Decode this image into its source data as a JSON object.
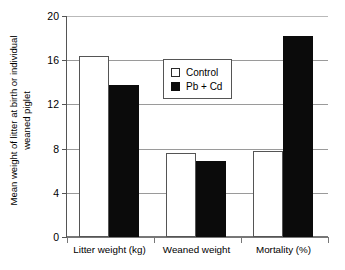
{
  "chart_data": {
    "type": "bar",
    "title": "",
    "xlabel": "",
    "ylabel_line1": "Mean weight of litter at birth or individual",
    "ylabel_line2": "weaned piglet",
    "categories": [
      "Litter weight (kg)",
      "Weaned weight",
      "Mortality (%)"
    ],
    "series": [
      {
        "name": "Control",
        "color": "#ffffff",
        "values": [
          16.4,
          7.6,
          7.8
        ]
      },
      {
        "name": "Pb + Cd",
        "color": "#0b0b0b",
        "values": [
          13.75,
          6.9,
          18.2
        ]
      }
    ],
    "ylim": [
      0,
      20
    ],
    "yticks": [
      0,
      4,
      8,
      12,
      16,
      20
    ],
    "ytick_labels": [
      "0",
      "4",
      "8",
      "12",
      "16",
      "20"
    ],
    "grid": true,
    "legend_position": "upper-center"
  },
  "legend": {
    "items": [
      {
        "label": "Control",
        "marker": "open-square"
      },
      {
        "label": "Pb + Cd",
        "marker": "filled-square"
      }
    ]
  }
}
